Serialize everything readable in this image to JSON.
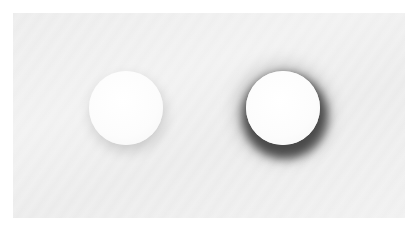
{
  "scene": {
    "description": "Two white circles on light gray panel demonstrating soft vs. strong drop shadow",
    "background_color": "#ffffff",
    "panel_color": "#eeeeee",
    "circles": [
      {
        "name": "soft-shadow-circle",
        "fill": "#ffffff",
        "shadow": "subtle light gray"
      },
      {
        "name": "strong-shadow-circle",
        "fill": "#ffffff",
        "shadow": "dark black"
      }
    ]
  }
}
